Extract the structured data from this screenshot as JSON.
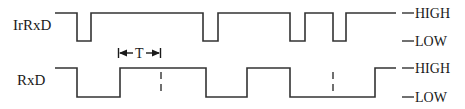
{
  "diagram": {
    "type": "timing-diagram",
    "signals": [
      {
        "name": "IrRxD",
        "high_y": 13,
        "low_y": 41,
        "label_y": 30,
        "segments": [
          [
            55,
            "H"
          ],
          [
            77,
            "L"
          ],
          [
            91,
            "H"
          ],
          [
            203,
            "L"
          ],
          [
            218,
            "H"
          ],
          [
            290,
            "L"
          ],
          [
            305,
            "H"
          ],
          [
            333,
            "L"
          ],
          [
            346,
            "H"
          ],
          [
            396,
            "end"
          ]
        ]
      },
      {
        "name": "RxD",
        "high_y": 68,
        "low_y": 97,
        "label_y": 85,
        "segments": [
          [
            55,
            "H"
          ],
          [
            77,
            "L"
          ],
          [
            120,
            "H"
          ],
          [
            206,
            "L"
          ],
          [
            247,
            "H"
          ],
          [
            290,
            "L"
          ],
          [
            375,
            "H"
          ],
          [
            396,
            "end"
          ]
        ]
      }
    ],
    "levels": [
      {
        "label": "HIGH",
        "signal": "IrRxD",
        "y": 17
      },
      {
        "label": "LOW",
        "signal": "IrRxD",
        "y": 46
      },
      {
        "label": "HIGH",
        "signal": "RxD",
        "y": 72
      },
      {
        "label": "LOW",
        "signal": "RxD",
        "y": 101
      }
    ],
    "period_marker": {
      "label": "T",
      "x_start": 118,
      "x_end": 160,
      "y": 53
    },
    "dashed_markers": [
      {
        "x": 161,
        "y_top": 72,
        "y_bottom": 96
      },
      {
        "x": 333,
        "y_top": 72,
        "y_bottom": 96
      }
    ],
    "colors": {
      "line": "#333333",
      "text": "#1a1a1a",
      "background": "#ffffff"
    }
  }
}
